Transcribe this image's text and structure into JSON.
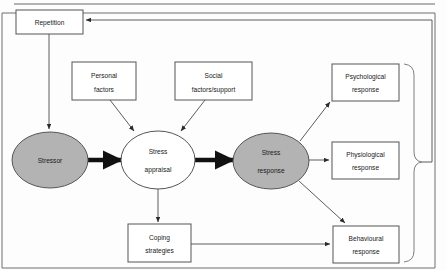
{
  "diagram": {
    "colors": {
      "node_fill_gray": "#b3b3b3",
      "node_fill_white": "#ffffff",
      "stroke": "#555555",
      "thick_arrow": "#111111",
      "frame": "#6f6f6f",
      "text": "#1a1a1a"
    },
    "boxes": [
      {
        "id": "repetition",
        "label_line1": "Repetition",
        "label_line2": ""
      },
      {
        "id": "personal",
        "label_line1": "Personal",
        "label_line2": "factors"
      },
      {
        "id": "social",
        "label_line1": "Social",
        "label_line2": "factors/support"
      },
      {
        "id": "psychological",
        "label_line1": "Psychological",
        "label_line2": "response"
      },
      {
        "id": "physiological",
        "label_line1": "Physiological",
        "label_line2": "response"
      },
      {
        "id": "behavioural",
        "label_line1": "Behavioural",
        "label_line2": "response"
      },
      {
        "id": "coping",
        "label_line1": "Coping",
        "label_line2": "strategies"
      }
    ],
    "ellipses": [
      {
        "id": "stressor",
        "label_line1": "Stressor",
        "label_line2": "",
        "fill": "gray"
      },
      {
        "id": "appraisal",
        "label_line1": "Stress",
        "label_line2": "appraisal",
        "fill": "white"
      },
      {
        "id": "response",
        "label_line1": "Stress",
        "label_line2": "response",
        "fill": "gray"
      }
    ],
    "connectors": [
      {
        "from": "repetition",
        "to": "stressor",
        "style": "thin"
      },
      {
        "from": "stressor",
        "to": "appraisal",
        "style": "thick"
      },
      {
        "from": "personal",
        "to": "appraisal",
        "style": "thin"
      },
      {
        "from": "social",
        "to": "appraisal",
        "style": "thin"
      },
      {
        "from": "appraisal",
        "to": "response",
        "style": "thick"
      },
      {
        "from": "appraisal",
        "to": "coping",
        "style": "thin"
      },
      {
        "from": "response",
        "to": "psychological",
        "style": "thin"
      },
      {
        "from": "response",
        "to": "physiological",
        "style": "thin"
      },
      {
        "from": "response",
        "to": "behavioural",
        "style": "thin"
      },
      {
        "from": "coping",
        "to": "behavioural",
        "style": "thin"
      },
      {
        "from": "responses-brace",
        "to": "repetition",
        "style": "thin-feedback"
      }
    ],
    "brace": {
      "groups": [
        "psychological",
        "physiological",
        "behavioural"
      ]
    }
  }
}
